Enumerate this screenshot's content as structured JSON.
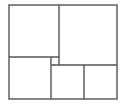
{
  "diagram": {
    "type": "rectangle-subdivision",
    "background": "#ffffff",
    "stroke": "#555555",
    "stroke_width": 1.4,
    "outer": {
      "x1": 9,
      "y1": 5,
      "x2": 117,
      "y2": 99
    },
    "segments": [
      {
        "id": "top-vertical-divider",
        "x1": 59,
        "y1": 5,
        "x2": 59,
        "y2": 65
      },
      {
        "id": "left-horizontal-divider",
        "x1": 9,
        "y1": 57,
        "x2": 59,
        "y2": 57
      },
      {
        "id": "small-vertical-divider",
        "x1": 51,
        "y1": 57,
        "x2": 51,
        "y2": 99
      },
      {
        "id": "right-horizontal-divider",
        "x1": 51,
        "y1": 65,
        "x2": 117,
        "y2": 65
      },
      {
        "id": "bottom-right-vertical-divider",
        "x1": 84,
        "y1": 65,
        "x2": 84,
        "y2": 99
      }
    ],
    "regions": [
      {
        "name": "top-left-square",
        "x": 9,
        "y": 5,
        "w": 50,
        "h": 52
      },
      {
        "name": "top-right-square",
        "x": 59,
        "y": 5,
        "w": 58,
        "h": 60
      },
      {
        "name": "bottom-left-square",
        "x": 9,
        "y": 57,
        "w": 42,
        "h": 42
      },
      {
        "name": "center-small-square",
        "x": 51,
        "y": 57,
        "w": 8,
        "h": 8
      },
      {
        "name": "bottom-middle-square",
        "x": 51,
        "y": 65,
        "w": 33,
        "h": 34
      },
      {
        "name": "bottom-right-square",
        "x": 84,
        "y": 65,
        "w": 33,
        "h": 34
      }
    ]
  }
}
